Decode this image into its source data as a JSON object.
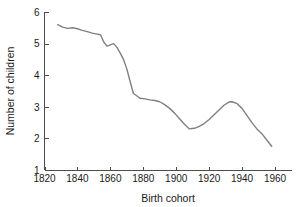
{
  "chart_data": {
    "type": "line",
    "title": "",
    "xlabel": "Birth cohort",
    "ylabel": "Number of children",
    "xlim": [
      1820,
      1968
    ],
    "ylim": [
      1,
      6
    ],
    "xticks": [
      1820,
      1840,
      1860,
      1880,
      1900,
      1920,
      1940,
      1960
    ],
    "yticks": [
      1,
      2,
      3,
      4,
      5,
      6
    ],
    "grid": false,
    "legend": null,
    "line_color": "#808080",
    "axis_color": "#4d4d4d",
    "series": [
      {
        "name": "Number of children",
        "x": [
          1828,
          1831,
          1834,
          1837,
          1840,
          1843,
          1846,
          1849,
          1852,
          1854,
          1856,
          1858,
          1860,
          1862,
          1864,
          1866,
          1868,
          1870,
          1872,
          1874,
          1876,
          1878,
          1881,
          1884,
          1887,
          1890,
          1893,
          1896,
          1899,
          1902,
          1905,
          1908,
          1911,
          1914,
          1917,
          1920,
          1923,
          1926,
          1929,
          1932,
          1934,
          1937,
          1940,
          1943,
          1946,
          1949,
          1952,
          1955,
          1958
        ],
        "values": [
          5.6,
          5.52,
          5.48,
          5.5,
          5.47,
          5.42,
          5.38,
          5.33,
          5.3,
          5.28,
          5.05,
          4.92,
          4.96,
          5.0,
          4.88,
          4.7,
          4.5,
          4.2,
          3.8,
          3.42,
          3.35,
          3.27,
          3.25,
          3.22,
          3.2,
          3.16,
          3.07,
          2.95,
          2.8,
          2.62,
          2.45,
          2.3,
          2.32,
          2.38,
          2.47,
          2.6,
          2.75,
          2.9,
          3.05,
          3.15,
          3.16,
          3.1,
          2.95,
          2.72,
          2.5,
          2.3,
          2.15,
          1.95,
          1.75
        ]
      }
    ]
  },
  "axis": {
    "x_tick_labels": [
      "1820",
      "1840",
      "1860",
      "1880",
      "1900",
      "1920",
      "1940",
      "1960"
    ],
    "y_tick_labels": [
      "1",
      "2",
      "3",
      "4",
      "5",
      "6"
    ],
    "x_title": "Birth cohort",
    "y_title": "Number of children"
  }
}
